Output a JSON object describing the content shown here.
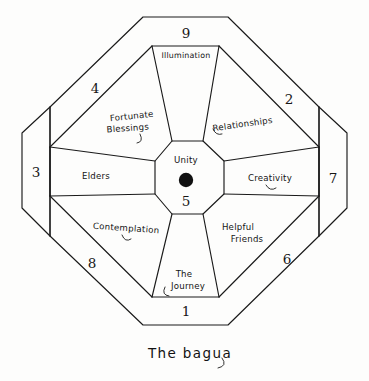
{
  "figure": {
    "caption": "The bagua",
    "center": {
      "label": "Unity",
      "number": "5",
      "marker": "black-dot"
    },
    "sectors": [
      {
        "id": "illumination",
        "number": "9",
        "label": "Illumination",
        "position": "top",
        "label_lines": [
          "Illumination"
        ]
      },
      {
        "id": "relationships",
        "number": "2",
        "label": "Relationships",
        "position": "upper-right",
        "label_lines": [
          "Relationships"
        ]
      },
      {
        "id": "creativity",
        "number": "7",
        "label": "Creativity",
        "position": "right",
        "label_lines": [
          "Creativity"
        ]
      },
      {
        "id": "helpful-friends",
        "number": "6",
        "label": "Helpful Friends",
        "position": "lower-right",
        "label_lines": [
          "Helpful",
          "Friends"
        ]
      },
      {
        "id": "the-journey",
        "number": "1",
        "label": "The Journey",
        "position": "bottom",
        "label_lines": [
          "The",
          "Journey"
        ]
      },
      {
        "id": "contemplation",
        "number": "8",
        "label": "Contemplation",
        "position": "lower-left",
        "label_lines": [
          "Contemplation"
        ]
      },
      {
        "id": "elders",
        "number": "3",
        "label": "Elders",
        "position": "left",
        "label_lines": [
          "Elders"
        ]
      },
      {
        "id": "fortunate-blessings",
        "number": "4",
        "label": "Fortunate Blessings",
        "position": "upper-left",
        "label_lines": [
          "Fortunate",
          "Blessings"
        ]
      }
    ],
    "colors": {
      "ink": "#1a1a1a",
      "paper": "#fdfdfc",
      "marker": "#111111"
    }
  }
}
